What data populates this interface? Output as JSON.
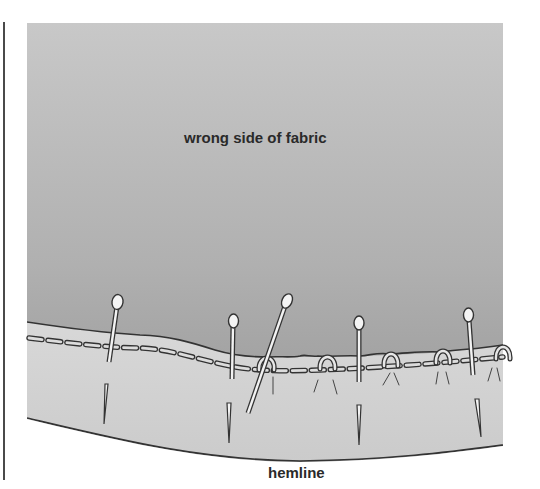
{
  "figure": {
    "type": "sewing-illustration",
    "labels": {
      "fabric": "wrong side of fabric",
      "hemline": "hemline"
    },
    "colors": {
      "fabric_top": "#c6c6c6",
      "fabric_bottom": "#979797",
      "hem_band": "#d2d2d2",
      "outline": "#333333",
      "background": "#ffffff",
      "pin": "#f4f4f4"
    },
    "elements": {
      "pins_vertical_count": 4,
      "pins_diagonal_count": 1,
      "loop_stitches_count": 6,
      "basting_stitch": "dashed"
    }
  }
}
